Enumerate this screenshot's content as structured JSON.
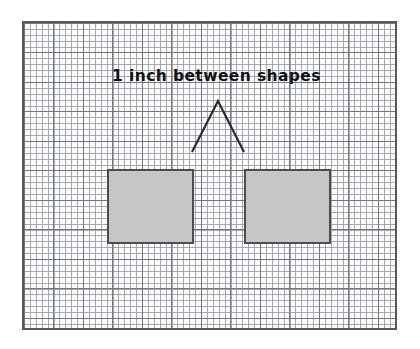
{
  "figure": {
    "caption": "1 inch between shapes",
    "frame": {
      "x": 22,
      "y": 21,
      "width": 375,
      "height": 309,
      "border_color": "#58585a",
      "paper_color": "#fdfdfd"
    },
    "grid": {
      "minor_spacing_px": 6,
      "major_spacing_px": 29.5,
      "minor_style": "dotted",
      "major_style": "solid",
      "minor_color": "#969ba5",
      "major_color": "#6e737d"
    },
    "shapes": [
      {
        "name": "left-square",
        "type": "square",
        "x": 105,
        "y": 167,
        "width": 87,
        "height": 75,
        "fill": "#c6c6c6",
        "stroke": "#4d4d4f",
        "stroke_width": 2
      },
      {
        "name": "right-square",
        "type": "square",
        "x": 242,
        "y": 167,
        "width": 87,
        "height": 75,
        "fill": "#c6c6c6",
        "stroke": "#4d4d4f",
        "stroke_width": 2
      }
    ],
    "annotation": {
      "name": "gap-caret",
      "type": "chevron-up",
      "apex": {
        "x": 216,
        "y": 99
      },
      "left_foot": {
        "x": 190,
        "y": 150
      },
      "right_foot": {
        "x": 242,
        "y": 150
      },
      "stroke": "#2b2b2b",
      "stroke_width": 2,
      "measures_gap_px": 52,
      "measures_gap_label": "1 inch"
    },
    "caption_style": {
      "color": "#121212",
      "font_size_px": 15.5,
      "bold": true
    }
  }
}
